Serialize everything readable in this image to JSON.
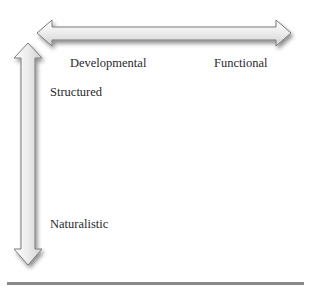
{
  "diagram": {
    "type": "two-axis conceptual diagram",
    "horizontal_axis": {
      "direction": "bidirectional",
      "labels": {
        "left": "Developmental",
        "right": "Functional"
      }
    },
    "vertical_axis": {
      "direction": "bidirectional",
      "labels": {
        "top": "Structured",
        "bottom": "Naturalistic"
      }
    },
    "colors": {
      "arrow_fill_light": "#f4f4f4",
      "arrow_fill_dark": "#d6d6d6",
      "arrow_stroke": "#7a7a7a",
      "arrow_shadow": "#9a9a9a",
      "text": "#2a2a2a",
      "rule": "#8a8a8a"
    }
  }
}
